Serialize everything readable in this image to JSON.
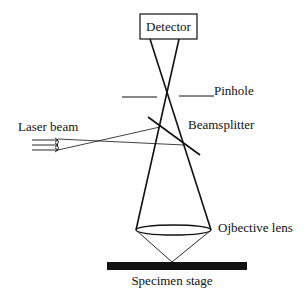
{
  "diagram": {
    "labels": {
      "detector": "Detector",
      "pinhole": "Pinhole",
      "laser_beam": "Laser beam",
      "beamsplitter": "Beamsplitter",
      "objective_lens": "Ojbective lens",
      "specimen_stage": "Specimen stage"
    },
    "colors": {
      "line": "#111111",
      "background": "#ffffff"
    }
  }
}
